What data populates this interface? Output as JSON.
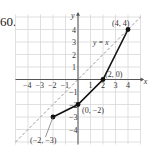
{
  "problem_number": "60.",
  "chart_data": {
    "type": "line",
    "title": "",
    "xlabel": "x",
    "ylabel": "y",
    "xlim": [
      -5,
      5
    ],
    "ylim": [
      -5,
      5
    ],
    "grid": true,
    "x_tick_labels": [
      "-4",
      "-3",
      "-2",
      "-1",
      "1",
      "2",
      "3",
      "4"
    ],
    "y_tick_labels": [
      "4",
      "3",
      "2",
      "1",
      "-1",
      "-2",
      "-3",
      "-4"
    ],
    "series": [
      {
        "name": "piecewise function",
        "style": "solid",
        "color": "#111111",
        "points": [
          [
            -2,
            -3
          ],
          [
            0,
            -2
          ],
          [
            2,
            0
          ],
          [
            4,
            4
          ]
        ]
      },
      {
        "name": "y = x",
        "style": "dashed",
        "color": "#999999",
        "points": [
          [
            -5,
            -5
          ],
          [
            5,
            5
          ]
        ]
      }
    ],
    "annotations": [
      {
        "text": "(4, 4)",
        "x": 4,
        "y": 4
      },
      {
        "text": "(2, 0)",
        "x": 2,
        "y": 0
      },
      {
        "text": "(0, −2)",
        "x": 0,
        "y": -2
      },
      {
        "text": "(−2, −3)",
        "x": -2,
        "y": -3
      },
      {
        "text": "y = x",
        "x": 1.2,
        "y": 2.8
      }
    ]
  }
}
